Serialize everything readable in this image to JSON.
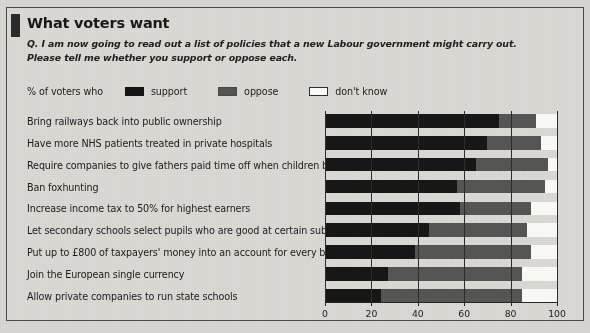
{
  "headline": "What voters want",
  "question": "Q. I am now going to read out a list of policies that a new Labour government might carry out. Please tell me whether you support or oppose each.",
  "legend": {
    "caption": "% of voters who",
    "entries": [
      {
        "label": "support",
        "key": "support",
        "color": "#171717"
      },
      {
        "label": "oppose",
        "key": "oppose",
        "color": "#565655"
      },
      {
        "label": "don't know",
        "key": "dontknow",
        "color": "#fbfbf8"
      }
    ]
  },
  "axis": {
    "ticks": [
      "0",
      "20",
      "40",
      "60",
      "80",
      "100"
    ],
    "min": 0,
    "max": 100
  },
  "chart_data": {
    "type": "bar",
    "orientation": "horizontal",
    "stacked": true,
    "title": "What voters want",
    "subtitle": "Q. I am now going to read out a list of policies that a new Labour government might carry out. Please tell me whether you support or oppose each.",
    "xlabel": "% of voters who",
    "ylabel": "",
    "xlim": [
      0,
      100
    ],
    "grid": true,
    "legend_position": "top",
    "categories": [
      "Bring railways back into public ownership",
      "Have more NHS patients treated in private hospitals",
      "Require companies to give fathers paid time off when children born",
      "Ban foxhunting",
      "Increase income tax to 50% for highest earners",
      "Let secondary schools select pupils who are good at certain subjects",
      "Put up to £800 of taxpayers' money into an account for every baby",
      "Join the European single currency",
      "Allow private companies to run state schools"
    ],
    "series": [
      {
        "name": "support",
        "values": [
          75,
          70,
          65,
          57,
          58,
          45,
          39,
          27,
          24
        ]
      },
      {
        "name": "oppose",
        "values": [
          16,
          23,
          31,
          38,
          31,
          42,
          50,
          58,
          61
        ]
      },
      {
        "name": "don't know",
        "values": [
          9,
          7,
          4,
          5,
          11,
          13,
          11,
          15,
          15
        ]
      }
    ]
  }
}
